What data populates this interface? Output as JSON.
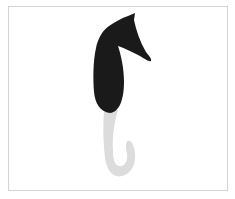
{
  "image": {
    "subject": "seahorse silhouette",
    "description": "Stylized seahorse: solid black head and body, light gray curled tail, inside a thin gray frame",
    "colors": {
      "background": "#ffffff",
      "frame_border": "#d4d4d4",
      "body": "#1a1a1a",
      "tail": "#dcdcdc"
    }
  }
}
